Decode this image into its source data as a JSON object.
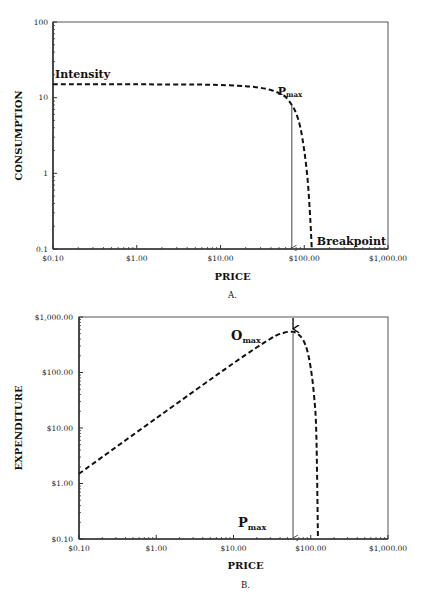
{
  "chart_data": [
    {
      "id": "A",
      "type": "line",
      "title": "",
      "panel_label": "A.",
      "xlabel": "PRICE",
      "ylabel": "CONSUMPTION",
      "xscale": "log",
      "yscale": "log",
      "xlim": [
        0.1,
        1000
      ],
      "ylim": [
        0.1,
        100
      ],
      "x_ticks": [
        "$0.10",
        "$1.00",
        "$10.00",
        "$100.00",
        "$1,000.00"
      ],
      "y_ticks": [
        "0.1",
        "1",
        "10",
        "100"
      ],
      "grid": false,
      "series": [
        {
          "name": "Demand curve",
          "style": "dashed",
          "x": [
            0.1,
            1,
            5,
            10,
            20,
            30,
            40,
            50,
            60,
            71,
            80,
            90,
            100,
            110,
            118,
            123
          ],
          "values": [
            15,
            15,
            14.9,
            14.7,
            14.2,
            13.5,
            12.6,
            11.5,
            10.2,
            8.0,
            6.2,
            4.0,
            2.0,
            0.8,
            0.25,
            0.1
          ]
        }
      ],
      "annotations": [
        {
          "text": "Intensity",
          "x": 0.1,
          "y": 15
        },
        {
          "text": "Pmax",
          "main": "P",
          "sub": "max",
          "x": 71,
          "y": 8,
          "arrow": "down to x-axis"
        },
        {
          "text": "Breakpoint",
          "x": 123,
          "y": 0.1
        }
      ]
    },
    {
      "id": "B",
      "type": "line",
      "title": "",
      "panel_label": "B.",
      "xlabel": "PRICE",
      "ylabel": "EXPENDITURE",
      "xscale": "log",
      "yscale": "log",
      "xlim": [
        0.1,
        1000
      ],
      "ylim": [
        0.1,
        1000
      ],
      "x_ticks": [
        "$0.10",
        "$1.00",
        "$10.00",
        "$100.00",
        "$1,000.00"
      ],
      "y_ticks": [
        "$0.10",
        "$1.00",
        "$10.00",
        "$100.00",
        "$1,000.00"
      ],
      "grid": false,
      "series": [
        {
          "name": "Expenditure curve",
          "style": "dashed",
          "x": [
            0.1,
            1,
            10,
            30,
            45,
            59,
            70,
            80,
            90,
            100,
            110,
            118,
            124
          ],
          "values": [
            1.5,
            15,
            147,
            405,
            520,
            540,
            480,
            380,
            250,
            120,
            40,
            8,
            0.1
          ]
        }
      ],
      "annotations": [
        {
          "text": "Omax",
          "main": "O",
          "sub": "max",
          "x": 59,
          "y": 540,
          "arrow": "down from top to peak"
        },
        {
          "text": "Pmax",
          "main": "P",
          "sub": "max",
          "x": 59,
          "y": 0.1,
          "arrow": "down to x-axis"
        }
      ]
    }
  ]
}
